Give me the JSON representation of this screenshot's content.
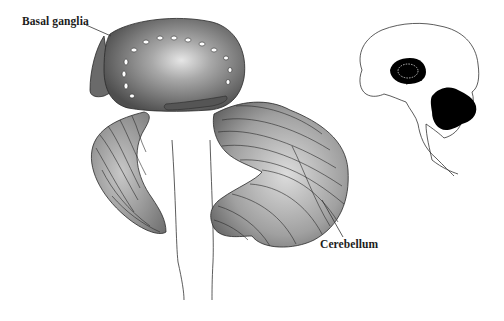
{
  "figure": {
    "type": "anatomical-illustration"
  },
  "labels": {
    "basal_ganglia": "Basal ganglia",
    "cerebellum": "Cerebellum"
  },
  "inset": {
    "description": "Sagittal brain outline with basal ganglia and cerebellum highlighted in black"
  },
  "colors": {
    "background": "#ffffff",
    "structure_dark": "#4a4a4a",
    "structure_mid": "#8a8a8a",
    "structure_light": "#d8d8d8",
    "outline": "#222222",
    "inset_fill": "#000000"
  }
}
